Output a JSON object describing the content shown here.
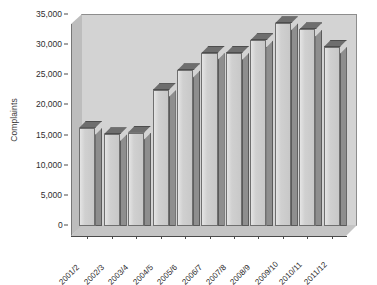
{
  "chart_data": {
    "type": "bar",
    "title": "",
    "xlabel": "",
    "ylabel": "Complaints",
    "categories": [
      "2001/2",
      "2002/3",
      "2003/4",
      "2004/5",
      "2005/6",
      "2006/7",
      "2007/8",
      "2008/9",
      "2009/10",
      "2010/11",
      "2011/12"
    ],
    "values": [
      16300,
      15200,
      15500,
      22500,
      25800,
      28700,
      28700,
      30800,
      33600,
      32600,
      29700
    ],
    "ylim": [
      0,
      35000
    ],
    "ytick_values": [
      0,
      5000,
      10000,
      15000,
      20000,
      25000,
      30000,
      35000
    ],
    "ytick_labels": [
      "0",
      "5,000",
      "10,000",
      "15,000",
      "20,000",
      "25,000",
      "30,000",
      "35,000"
    ],
    "grid": false,
    "legend": null,
    "style": "3d-bar-grayscale",
    "colors": {
      "plot_background": "#d3d3d3",
      "bar_front": "#d0d0d0",
      "bar_side": "#8e8e8e",
      "bar_top": "#6e6e6e",
      "axis": "#4a4a4a",
      "text": "#2e2e2e",
      "page_background": "#ffffff"
    }
  }
}
